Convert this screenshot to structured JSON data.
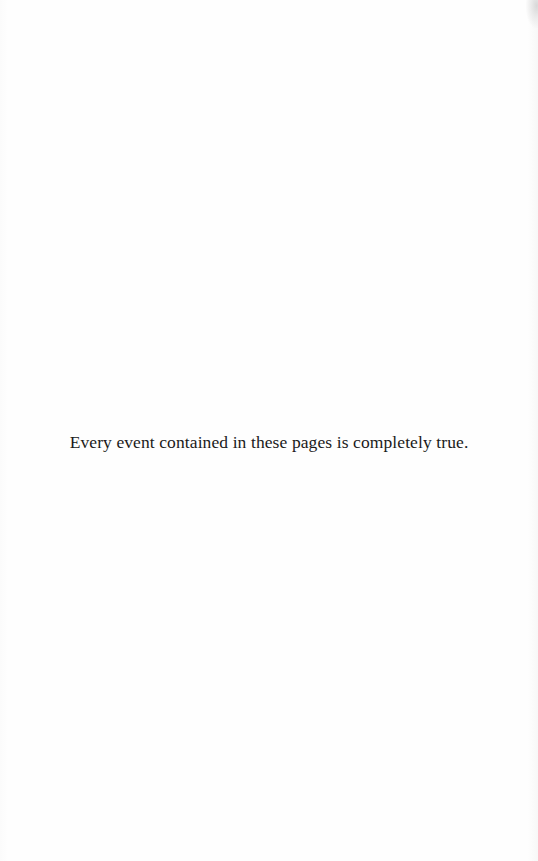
{
  "page": {
    "epigraph": "Every event contained in these pages is completely true."
  }
}
